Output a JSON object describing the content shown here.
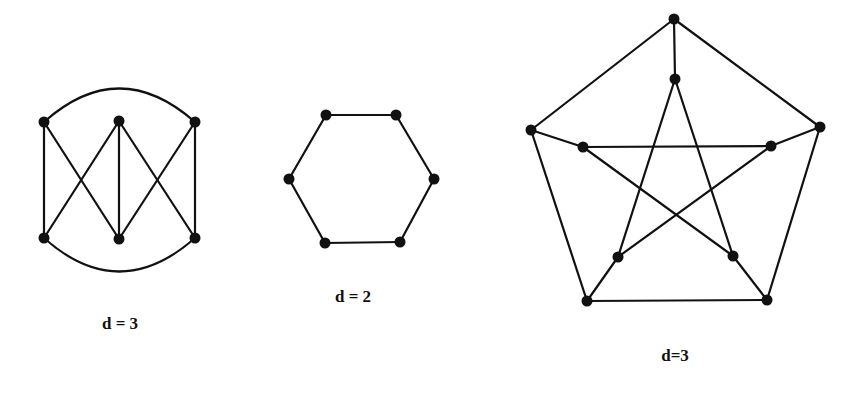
{
  "colors": {
    "ink": "#111111",
    "background": "#ffffff"
  },
  "graphs": [
    {
      "id": "graph-1",
      "label": "d = 3",
      "label_pos": [
        120,
        314
      ],
      "vertices": [
        [
          44,
          122
        ],
        [
          119,
          121
        ],
        [
          195,
          122
        ],
        [
          44,
          238
        ],
        [
          119,
          239
        ],
        [
          195,
          238
        ]
      ],
      "edges": [
        [
          0,
          3
        ],
        [
          2,
          5
        ],
        [
          0,
          4
        ],
        [
          1,
          3
        ],
        [
          1,
          4
        ],
        [
          1,
          5
        ],
        [
          2,
          4
        ]
      ],
      "arcs": [
        {
          "from": 0,
          "to": 2,
          "control": [
            119,
            55
          ]
        },
        {
          "from": 3,
          "to": 5,
          "control": [
            119,
            305
          ]
        }
      ]
    },
    {
      "id": "graph-2",
      "label": "d = 2",
      "label_pos": [
        353,
        287
      ],
      "vertices": [
        [
          326,
          115
        ],
        [
          396,
          115
        ],
        [
          434,
          179
        ],
        [
          400,
          242
        ],
        [
          325,
          243
        ],
        [
          289,
          179
        ]
      ],
      "edges": [
        [
          0,
          1
        ],
        [
          1,
          2
        ],
        [
          2,
          3
        ],
        [
          3,
          4
        ],
        [
          4,
          5
        ],
        [
          5,
          0
        ]
      ],
      "arcs": []
    },
    {
      "id": "graph-3",
      "label": "d=3",
      "label_pos": [
        675,
        346
      ],
      "vertices": [
        [
          674,
          19
        ],
        [
          820,
          127
        ],
        [
          767,
          300
        ],
        [
          587,
          301
        ],
        [
          531,
          130
        ],
        [
          675,
          79
        ],
        [
          771,
          146
        ],
        [
          733,
          256
        ],
        [
          618,
          257
        ],
        [
          583,
          147
        ]
      ],
      "edges": [
        [
          0,
          1
        ],
        [
          1,
          2
        ],
        [
          2,
          3
        ],
        [
          3,
          4
        ],
        [
          4,
          0
        ],
        [
          0,
          5
        ],
        [
          1,
          6
        ],
        [
          2,
          7
        ],
        [
          3,
          8
        ],
        [
          4,
          9
        ],
        [
          5,
          8
        ],
        [
          5,
          7
        ],
        [
          6,
          9
        ],
        [
          6,
          8
        ],
        [
          9,
          7
        ]
      ],
      "arcs": []
    }
  ]
}
